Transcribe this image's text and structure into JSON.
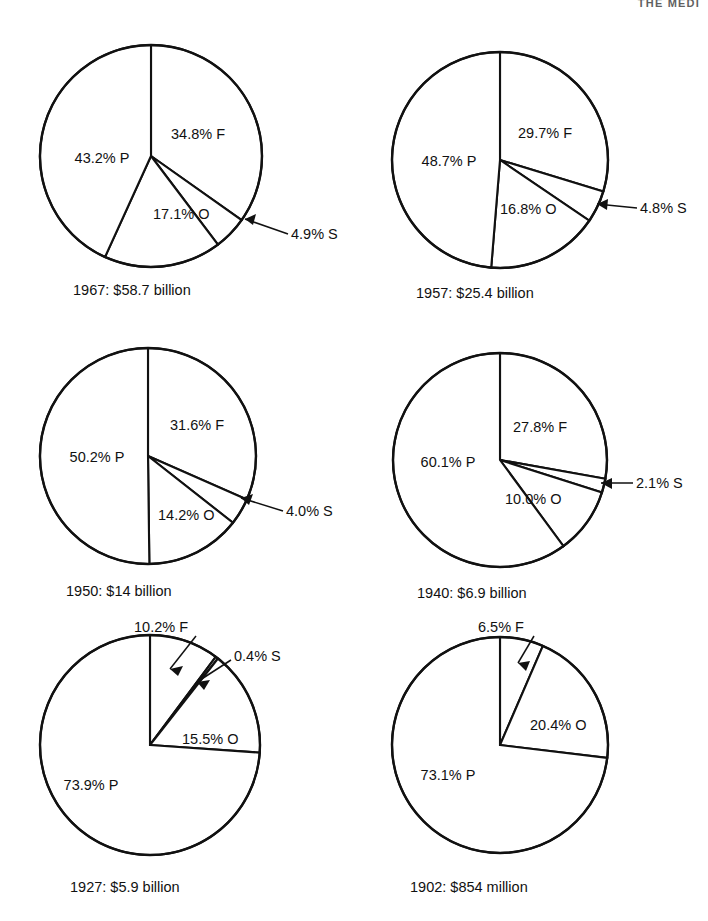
{
  "page": {
    "running_head": "THE MEDI",
    "background": "#ffffff",
    "ink": "#111111"
  },
  "chart_data": [
    {
      "type": "pie",
      "title": "1967: $58.7 billion",
      "year": "1967",
      "total": "$58.7 billion",
      "categories": [
        "F",
        "S",
        "O",
        "P"
      ],
      "values": [
        34.8,
        4.9,
        17.1,
        43.2
      ],
      "labels": [
        "34.8% F",
        "4.9% S",
        "17.1% O",
        "43.2% P"
      ],
      "start_angle": 0,
      "direction": "clockwise",
      "label_style": [
        "inside",
        "outside-right",
        "inside",
        "inside"
      ]
    },
    {
      "type": "pie",
      "title": "1957: $25.4 billion",
      "year": "1957",
      "total": "$25.4 billion",
      "categories": [
        "F",
        "S",
        "O",
        "P"
      ],
      "values": [
        29.7,
        4.8,
        16.8,
        48.7
      ],
      "labels": [
        "29.7% F",
        "4.8% S",
        "16.8% O",
        "48.7% P"
      ],
      "start_angle": 0,
      "direction": "clockwise",
      "label_style": [
        "inside",
        "outside-right",
        "inside",
        "inside"
      ]
    },
    {
      "type": "pie",
      "title": "1950: $14 billion",
      "year": "1950",
      "total": "$14 billion",
      "categories": [
        "F",
        "S",
        "O",
        "P"
      ],
      "values": [
        31.6,
        4.0,
        14.2,
        50.2
      ],
      "labels": [
        "31.6% F",
        "4.0% S",
        "14.2% O",
        "50.2% P"
      ],
      "start_angle": 0,
      "direction": "clockwise",
      "label_style": [
        "inside",
        "outside-right",
        "inside",
        "inside"
      ]
    },
    {
      "type": "pie",
      "title": "1940: $6.9 billion",
      "year": "1940",
      "total": "$6.9 billion",
      "categories": [
        "F",
        "S",
        "O",
        "P"
      ],
      "values": [
        27.8,
        2.1,
        10.0,
        60.1
      ],
      "labels": [
        "27.8% F",
        "2.1% S",
        "10.0% O",
        "60.1% P"
      ],
      "start_angle": 0,
      "direction": "clockwise",
      "label_style": [
        "inside",
        "outside-right",
        "inside",
        "inside"
      ]
    },
    {
      "type": "pie",
      "title": "1927: $5.9 billion",
      "year": "1927",
      "total": "$5.9 billion",
      "categories": [
        "F",
        "S",
        "O",
        "P"
      ],
      "values": [
        10.2,
        0.4,
        15.5,
        73.9
      ],
      "labels": [
        "10.2% F",
        "0.4% S",
        "15.5% O",
        "73.9% P"
      ],
      "start_angle": 0,
      "direction": "clockwise",
      "label_style": [
        "outside-top",
        "outside-top-right",
        "inside",
        "inside"
      ]
    },
    {
      "type": "pie",
      "title": "1902: $854 million",
      "year": "1902",
      "total": "$854 million",
      "categories": [
        "F",
        "O",
        "P"
      ],
      "values": [
        6.5,
        20.4,
        73.1
      ],
      "labels": [
        "6.5% F",
        "20.4% O",
        "73.1% P"
      ],
      "start_angle": 0,
      "direction": "clockwise",
      "label_style": [
        "outside-top",
        "inside",
        "inside"
      ]
    }
  ],
  "charts": {
    "c1967": {
      "caption": "1967: $58.7 billion",
      "slice_f": "34.8% F",
      "slice_s": "4.9% S",
      "slice_o": "17.1% O",
      "slice_p": "43.2% P"
    },
    "c1957": {
      "caption": "1957: $25.4 billion",
      "slice_f": "29.7% F",
      "slice_s": "4.8% S",
      "slice_o": "16.8% O",
      "slice_p": "48.7% P"
    },
    "c1950": {
      "caption": "1950: $14 billion",
      "slice_f": "31.6% F",
      "slice_s": "4.0% S",
      "slice_o": "14.2% O",
      "slice_p": "50.2% P"
    },
    "c1940": {
      "caption": "1940: $6.9 billion",
      "slice_f": "27.8% F",
      "slice_s": "2.1% S",
      "slice_o": "10.0% O",
      "slice_p": "60.1% P"
    },
    "c1927": {
      "caption": "1927: $5.9 billion",
      "slice_f": "10.2% F",
      "slice_s": "0.4% S",
      "slice_o": "15.5% O",
      "slice_p": "73.9% P"
    },
    "c1902": {
      "caption": "1902: $854 million",
      "slice_f": "6.5% F",
      "slice_o": "20.4% O",
      "slice_p": "73.1% P"
    }
  }
}
